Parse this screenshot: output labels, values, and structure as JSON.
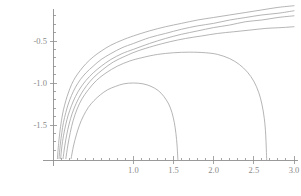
{
  "chart_data": {
    "type": "line",
    "title": "",
    "subtitle": "",
    "xlabel": "",
    "ylabel": "",
    "xlim": [
      -0.12,
      3.05
    ],
    "ylim": [
      -1.92,
      -0.12
    ],
    "grid": false,
    "legend_position": "none",
    "background_color": "#ffffff",
    "curve_color": "#a8a8a8",
    "axis_color": "#8f8f8f",
    "tick_label_color": "#8a8a8a",
    "x_ticks_major": [
      1.0,
      1.5,
      2.0,
      2.5,
      3.0
    ],
    "x_tick_labels": [
      "1.0",
      "1.5",
      "2.0",
      "2.5",
      "3.0"
    ],
    "x_ticks_minor": [
      0.1,
      0.2,
      0.3,
      0.4,
      0.5,
      0.6,
      0.7,
      0.8,
      0.9,
      1.1,
      1.2,
      1.3,
      1.4,
      1.6,
      1.7,
      1.8,
      1.9,
      2.1,
      2.2,
      2.3,
      2.4,
      2.6,
      2.7,
      2.8,
      2.9
    ],
    "y_ticks_major": [
      -0.5,
      -1.0,
      -1.5
    ],
    "y_tick_labels": [
      "-0.5",
      "-1.0",
      "-1.5"
    ],
    "y_ticks_minor": [
      -0.2,
      -0.3,
      -0.4,
      -0.6,
      -0.7,
      -0.8,
      -0.9,
      -1.1,
      -1.2,
      -1.3,
      -1.4,
      -1.6,
      -1.7,
      -1.8
    ],
    "series": [
      {
        "name": "curve-1",
        "note": "topmost curve, rises to about -0.08 at x=3.0",
        "points": [
          [
            0.055,
            -1.9
          ],
          [
            0.07,
            -1.72
          ],
          [
            0.09,
            -1.55
          ],
          [
            0.11,
            -1.42
          ],
          [
            0.13,
            -1.32
          ],
          [
            0.16,
            -1.21
          ],
          [
            0.19,
            -1.12
          ],
          [
            0.23,
            -1.02
          ],
          [
            0.28,
            -0.93
          ],
          [
            0.34,
            -0.85
          ],
          [
            0.41,
            -0.77
          ],
          [
            0.5,
            -0.69
          ],
          [
            0.6,
            -0.62
          ],
          [
            0.72,
            -0.55
          ],
          [
            0.86,
            -0.49
          ],
          [
            1.0,
            -0.44
          ],
          [
            1.2,
            -0.38
          ],
          [
            1.4,
            -0.33
          ],
          [
            1.6,
            -0.29
          ],
          [
            1.8,
            -0.25
          ],
          [
            2.0,
            -0.22
          ],
          [
            2.2,
            -0.19
          ],
          [
            2.4,
            -0.16
          ],
          [
            2.6,
            -0.13
          ],
          [
            2.8,
            -0.1
          ],
          [
            3.0,
            -0.08
          ]
        ]
      },
      {
        "name": "curve-2",
        "note": "second curve, reaches about -0.14 at x=3.0",
        "points": [
          [
            0.075,
            -1.9
          ],
          [
            0.09,
            -1.74
          ],
          [
            0.11,
            -1.59
          ],
          [
            0.13,
            -1.47
          ],
          [
            0.16,
            -1.35
          ],
          [
            0.19,
            -1.25
          ],
          [
            0.23,
            -1.15
          ],
          [
            0.28,
            -1.05
          ],
          [
            0.34,
            -0.96
          ],
          [
            0.41,
            -0.88
          ],
          [
            0.5,
            -0.8
          ],
          [
            0.6,
            -0.72
          ],
          [
            0.72,
            -0.65
          ],
          [
            0.86,
            -0.58
          ],
          [
            1.0,
            -0.53
          ],
          [
            1.2,
            -0.46
          ],
          [
            1.4,
            -0.41
          ],
          [
            1.6,
            -0.36
          ],
          [
            1.8,
            -0.32
          ],
          [
            2.0,
            -0.29
          ],
          [
            2.2,
            -0.25
          ],
          [
            2.4,
            -0.22
          ],
          [
            2.6,
            -0.19
          ],
          [
            2.8,
            -0.17
          ],
          [
            3.0,
            -0.14
          ]
        ]
      },
      {
        "name": "curve-3",
        "note": "third curve, reaches about -0.20 at x=3.0",
        "points": [
          [
            0.095,
            -1.9
          ],
          [
            0.11,
            -1.76
          ],
          [
            0.13,
            -1.63
          ],
          [
            0.16,
            -1.49
          ],
          [
            0.19,
            -1.38
          ],
          [
            0.23,
            -1.27
          ],
          [
            0.28,
            -1.16
          ],
          [
            0.34,
            -1.06
          ],
          [
            0.41,
            -0.97
          ],
          [
            0.5,
            -0.88
          ],
          [
            0.6,
            -0.8
          ],
          [
            0.72,
            -0.72
          ],
          [
            0.86,
            -0.65
          ],
          [
            1.0,
            -0.6
          ],
          [
            1.2,
            -0.53
          ],
          [
            1.4,
            -0.47
          ],
          [
            1.6,
            -0.42
          ],
          [
            1.8,
            -0.38
          ],
          [
            2.0,
            -0.34
          ],
          [
            2.2,
            -0.31
          ],
          [
            2.4,
            -0.27
          ],
          [
            2.6,
            -0.25
          ],
          [
            2.8,
            -0.22
          ],
          [
            3.0,
            -0.2
          ]
        ]
      },
      {
        "name": "curve-4",
        "note": "fourth curve, flattens near -0.33 at x=3.0",
        "points": [
          [
            0.125,
            -1.9
          ],
          [
            0.145,
            -1.76
          ],
          [
            0.17,
            -1.62
          ],
          [
            0.2,
            -1.49
          ],
          [
            0.24,
            -1.36
          ],
          [
            0.29,
            -1.24
          ],
          [
            0.35,
            -1.13
          ],
          [
            0.42,
            -1.03
          ],
          [
            0.51,
            -0.93
          ],
          [
            0.62,
            -0.84
          ],
          [
            0.75,
            -0.75
          ],
          [
            0.9,
            -0.68
          ],
          [
            1.05,
            -0.62
          ],
          [
            1.25,
            -0.56
          ],
          [
            1.45,
            -0.51
          ],
          [
            1.65,
            -0.47
          ],
          [
            1.85,
            -0.44
          ],
          [
            2.05,
            -0.41
          ],
          [
            2.25,
            -0.39
          ],
          [
            2.45,
            -0.37
          ],
          [
            2.65,
            -0.35
          ],
          [
            2.85,
            -0.34
          ],
          [
            3.0,
            -0.33
          ]
        ]
      },
      {
        "name": "curve-5",
        "note": "curve peaking near -0.63 around x=1.7 then plunging to -infinity at x=2.65",
        "points": [
          [
            0.16,
            -1.9
          ],
          [
            0.185,
            -1.74
          ],
          [
            0.215,
            -1.59
          ],
          [
            0.25,
            -1.45
          ],
          [
            0.3,
            -1.31
          ],
          [
            0.36,
            -1.19
          ],
          [
            0.44,
            -1.08
          ],
          [
            0.54,
            -0.97
          ],
          [
            0.66,
            -0.88
          ],
          [
            0.8,
            -0.8
          ],
          [
            0.95,
            -0.74
          ],
          [
            1.1,
            -0.7
          ],
          [
            1.3,
            -0.66
          ],
          [
            1.5,
            -0.64
          ],
          [
            1.7,
            -0.633
          ],
          [
            1.9,
            -0.64
          ],
          [
            2.05,
            -0.66
          ],
          [
            2.2,
            -0.71
          ],
          [
            2.32,
            -0.78
          ],
          [
            2.42,
            -0.87
          ],
          [
            2.5,
            -0.98
          ],
          [
            2.56,
            -1.11
          ],
          [
            2.6,
            -1.25
          ],
          [
            2.63,
            -1.42
          ],
          [
            2.648,
            -1.62
          ],
          [
            2.66,
            -1.92
          ]
        ]
      },
      {
        "name": "curve-6",
        "note": "lowest curve peaking at about -1.00 at x=1.0, plunging to -infinity at x=1.55",
        "points": [
          [
            0.225,
            -1.9
          ],
          [
            0.255,
            -1.75
          ],
          [
            0.29,
            -1.62
          ],
          [
            0.33,
            -1.5
          ],
          [
            0.38,
            -1.39
          ],
          [
            0.44,
            -1.29
          ],
          [
            0.51,
            -1.21
          ],
          [
            0.59,
            -1.14
          ],
          [
            0.68,
            -1.08
          ],
          [
            0.78,
            -1.04
          ],
          [
            0.88,
            -1.01
          ],
          [
            1.0,
            -1.0
          ],
          [
            1.12,
            -1.01
          ],
          [
            1.22,
            -1.04
          ],
          [
            1.31,
            -1.09
          ],
          [
            1.38,
            -1.16
          ],
          [
            1.44,
            -1.25
          ],
          [
            1.48,
            -1.35
          ],
          [
            1.51,
            -1.47
          ],
          [
            1.53,
            -1.6
          ],
          [
            1.545,
            -1.75
          ],
          [
            1.555,
            -1.92
          ]
        ]
      }
    ]
  }
}
